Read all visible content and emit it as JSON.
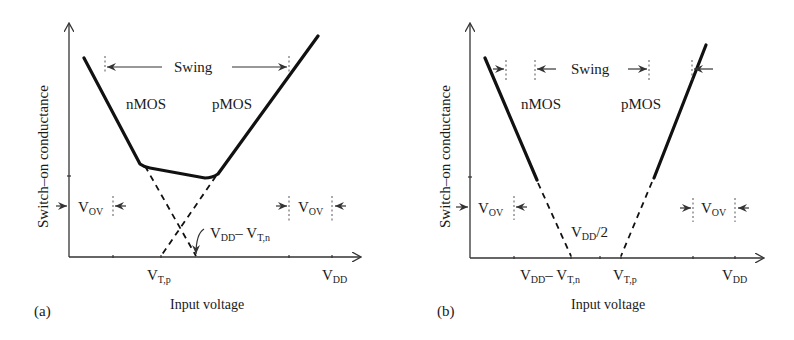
{
  "figure": {
    "panels": [
      {
        "id": "a",
        "tag": "(a)",
        "ylabel": "Switch–on conductance",
        "xlabel": "Input voltage",
        "swing_label": "Swing",
        "nmos_label": "nMOS",
        "pmos_label": "pMOS",
        "vov_left": {
          "main": "V",
          "sub": "OV"
        },
        "vov_right": {
          "main": "V",
          "sub": "OV"
        },
        "x_ticks": [
          {
            "main": "V",
            "sub": "T,p",
            "rest": ""
          },
          {
            "main": "V",
            "sub": "DD",
            "rest": ""
          }
        ],
        "annotation": {
          "main1": "V",
          "sub1": "DD",
          "dash": "– ",
          "main2": "V",
          "sub2": "T,n"
        }
      },
      {
        "id": "b",
        "tag": "(b)",
        "ylabel": "Switch–on conductance",
        "xlabel": "Input voltage",
        "swing_label": "Swing",
        "nmos_label": "nMOS",
        "pmos_label": "pMOS",
        "vov_left": {
          "main": "V",
          "sub": "OV"
        },
        "vov_right": {
          "main": "V",
          "sub": "OV"
        },
        "x_ticks": [
          {
            "main1": "V",
            "sub1": "DD",
            "dash": "– ",
            "main2": "V",
            "sub2": "T,n"
          },
          {
            "main": "V",
            "sub": "T,p"
          },
          {
            "main": "V",
            "sub": "DD"
          }
        ],
        "annotation": {
          "main": "V",
          "sub": "DD",
          "rest": "/2"
        }
      }
    ]
  }
}
